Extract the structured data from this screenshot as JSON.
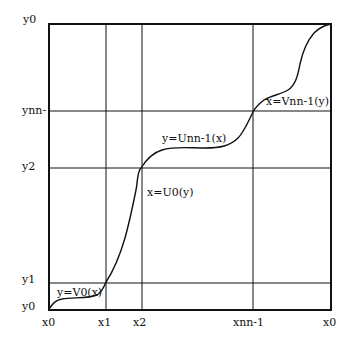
{
  "diagram": {
    "type": "piecewise monotone curve on grid",
    "box": {
      "left": 49,
      "top": 24,
      "right": 331,
      "bottom": 310
    },
    "colors": {
      "line": "#111111",
      "background": "#ffffff"
    },
    "vertical_lines": [
      {
        "id": "x1",
        "x": 106
      },
      {
        "id": "x2",
        "x": 142
      },
      {
        "id": "xnn-1",
        "x": 253
      }
    ],
    "horizontal_lines": [
      {
        "id": "ynn-1",
        "y": 111
      },
      {
        "id": "y2",
        "y": 168
      },
      {
        "id": "y1",
        "y": 283
      }
    ],
    "x_axis_labels": [
      "x0",
      "x1",
      "x2",
      "xnn-1",
      "x0"
    ],
    "y_axis_labels": [
      "y0",
      "ynn-",
      "y2",
      "y1",
      "y0"
    ],
    "curve_labels": {
      "v0": "y=V0(x)",
      "u0": "x=U0(y)",
      "unn1": "y=Unn-1(x)",
      "vnn1": "x=Vnn-1(y)"
    }
  }
}
